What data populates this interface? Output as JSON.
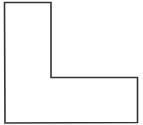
{
  "diagram": {
    "shape": "L-shaped polygon outline",
    "stroke_color": "#333333",
    "fill_color": "#ffffff",
    "background": "#ffffff",
    "stroke_width": 1.6,
    "points": [
      [
        4.5,
        2.5
      ],
      [
        51,
        2.5
      ],
      [
        51,
        77.5
      ],
      [
        137.5,
        77.5
      ],
      [
        137.5,
        122.5
      ],
      [
        5,
        123
      ]
    ]
  }
}
